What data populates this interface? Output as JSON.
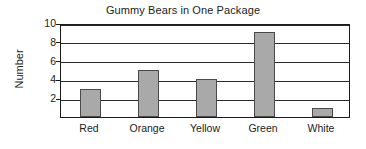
{
  "chart_data": {
    "type": "bar",
    "title": "Gummy Bears in One Package",
    "xlabel": "",
    "ylabel": "Number",
    "categories": [
      "Red",
      "Orange",
      "Yellow",
      "Green",
      "White"
    ],
    "values": [
      3,
      5,
      4,
      9,
      1
    ],
    "ylim": [
      0,
      10
    ],
    "yticks": [
      2,
      4,
      6,
      8,
      10
    ],
    "ytick_labels": [
      "2",
      "4",
      "6",
      "8",
      "10"
    ],
    "grid": true,
    "legend": false,
    "bar_color": "#a9a9a9",
    "bar_border_color": "#4a4a4a",
    "axis_color": "#1a1a1a",
    "background_color": "#ffffff"
  }
}
